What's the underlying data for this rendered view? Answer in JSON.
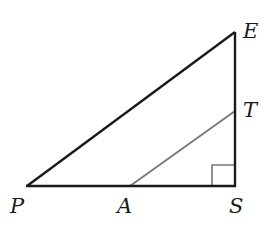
{
  "diagram": {
    "type": "right-triangle",
    "points": {
      "P": {
        "label": "P",
        "x": 27,
        "y": 186
      },
      "A": {
        "label": "A",
        "x": 130,
        "y": 186
      },
      "S": {
        "label": "S",
        "x": 235,
        "y": 186
      },
      "T": {
        "label": "T",
        "x": 235,
        "y": 111
      },
      "E": {
        "label": "E",
        "x": 235,
        "y": 32
      }
    },
    "segments": [
      {
        "name": "PE",
        "color": "#1a1a1a"
      },
      {
        "name": "ES",
        "color": "#1a1a1a"
      },
      {
        "name": "PS",
        "color": "#1a1a1a"
      },
      {
        "name": "AT",
        "color": "#7a7a7a"
      }
    ],
    "right_angle_at": "S",
    "labels": {
      "P": "P",
      "A": "A",
      "S": "S",
      "T": "T",
      "E": "E"
    }
  }
}
